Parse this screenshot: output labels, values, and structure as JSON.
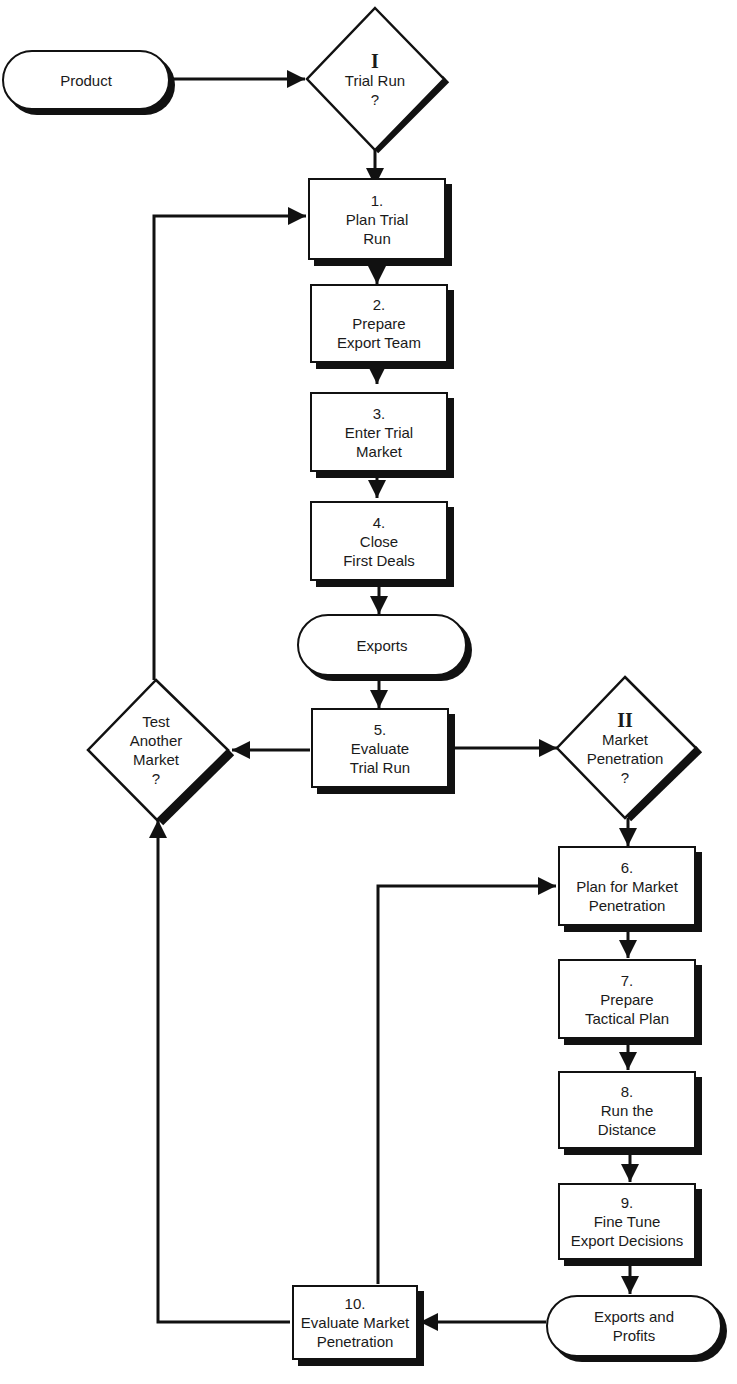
{
  "diagram": {
    "type": "flowchart",
    "title_fragment": "",
    "start": {
      "label": "Product"
    },
    "decisions": {
      "trial_run": {
        "roman": "I",
        "line1": "Trial Run",
        "line2": "?"
      },
      "market_penetration": {
        "roman": "II",
        "line1": "Market",
        "line2": "Penetration",
        "line3": "?"
      },
      "test_another": {
        "line1": "Test",
        "line2": "Another",
        "line3": "Market",
        "line4": "?"
      }
    },
    "steps": [
      {
        "num": "1.",
        "line1": "Plan Trial",
        "line2": "Run"
      },
      {
        "num": "2.",
        "line1": "Prepare",
        "line2": "Export Team"
      },
      {
        "num": "3.",
        "line1": "Enter Trial",
        "line2": "Market"
      },
      {
        "num": "4.",
        "line1": "Close",
        "line2": "First Deals"
      },
      {
        "num": "5.",
        "line1": "Evaluate",
        "line2": "Trial Run"
      },
      {
        "num": "6.",
        "line1": "Plan for Market",
        "line2": "Penetration"
      },
      {
        "num": "7.",
        "line1": "Prepare",
        "line2": "Tactical Plan"
      },
      {
        "num": "8.",
        "line1": "Run the",
        "line2": "Distance"
      },
      {
        "num": "9.",
        "line1": "Fine Tune",
        "line2": "Export Decisions"
      },
      {
        "num": "10.",
        "line1": "Evaluate Market",
        "line2": "Penetration"
      }
    ],
    "terminals": {
      "exports": {
        "label": "Exports"
      },
      "exports_profits": {
        "line1": "Exports and",
        "line2": "Profits"
      }
    },
    "colors": {
      "stroke": "#111111",
      "fill": "#ffffff",
      "text": "#1a1a1a"
    }
  }
}
